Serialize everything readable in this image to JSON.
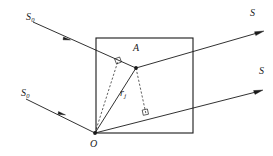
{
  "figure": {
    "kind": "optical-scattering-geometry-diagram",
    "background_color": "#ffffff",
    "stroke_color": "#1a1a1a",
    "labels": {
      "incident_upper": "S",
      "incident_upper_sub": "0",
      "incident_lower": "S",
      "incident_lower_sub": "0",
      "scattered_upper": "S",
      "scattered_lower": "S",
      "point_a": "A",
      "point_o": "O",
      "distance_vector": "r",
      "distance_vector_sub": "j"
    },
    "geometry": {
      "box": {
        "x": 96,
        "y": 38,
        "width": 97,
        "height": 95
      },
      "point_o": {
        "x": 95,
        "y": 133
      },
      "point_a": {
        "x": 136,
        "y": 68
      },
      "incident_upper_start": {
        "x": 33,
        "y": 22
      },
      "incident_upper_end": {
        "x": 136,
        "y": 68
      },
      "incident_lower_start": {
        "x": 26,
        "y": 99
      },
      "incident_lower_end": {
        "x": 95,
        "y": 133
      },
      "scattered_upper_start": {
        "x": 136,
        "y": 68
      },
      "scattered_upper_end": {
        "x": 264,
        "y": 31
      },
      "scattered_lower_start": {
        "x": 95,
        "y": 133
      },
      "scattered_lower_end": {
        "x": 263,
        "y": 90
      },
      "foot_upper": {
        "x": 118,
        "y": 61
      },
      "foot_lower": {
        "x": 146,
        "y": 114
      }
    }
  }
}
